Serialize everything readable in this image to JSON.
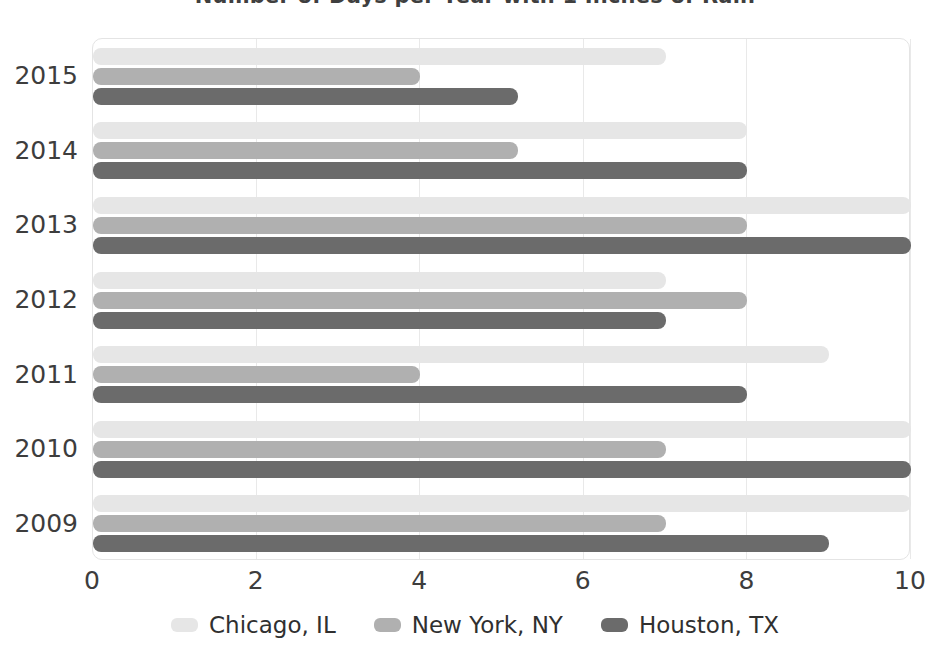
{
  "chart_data": {
    "type": "bar",
    "orientation": "horizontal",
    "title": "Number of Days per Year with 1 Inches of Rain",
    "xlabel": "",
    "ylabel": "",
    "categories": [
      "2015",
      "2014",
      "2013",
      "2012",
      "2011",
      "2010",
      "2009"
    ],
    "xticks": [
      "0",
      "2",
      "4",
      "6",
      "8",
      "10"
    ],
    "xlim": [
      0,
      10
    ],
    "grid": true,
    "legend_position": "bottom",
    "series": [
      {
        "name": "Chicago, IL",
        "color": "#e6e6e6",
        "values": [
          7,
          8,
          10,
          7,
          9,
          10,
          10
        ]
      },
      {
        "name": "New York, NY",
        "color": "#b0b0b0",
        "values": [
          4,
          5.2,
          8,
          8,
          4,
          7,
          7
        ]
      },
      {
        "name": "Houston, TX",
        "color": "#6b6b6b",
        "values": [
          5.2,
          8,
          10,
          7,
          8,
          10,
          9
        ]
      }
    ]
  }
}
